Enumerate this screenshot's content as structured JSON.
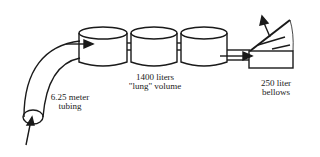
{
  "diagram": {
    "labels": {
      "tubing_line1": "6.25 meter",
      "tubing_line2": "tubing",
      "lung_line1": "1400 liters",
      "lung_line2": "\"lung\" volume",
      "bellows_line1": "250 liter",
      "bellows_line2": "bellows"
    },
    "components": [
      "inlet-arrow",
      "tubing",
      "cylinder-1",
      "cylinder-2",
      "cylinder-3",
      "connector-pipe",
      "bellows",
      "outlet-arrow"
    ],
    "colors": {
      "stroke": "#1a1a1a",
      "background": "#ffffff"
    }
  }
}
